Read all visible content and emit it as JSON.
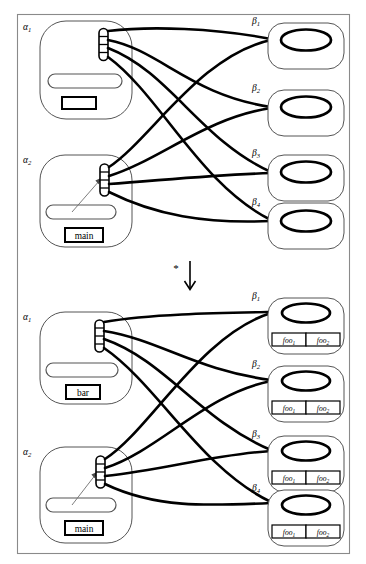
{
  "figure": {
    "transform_symbol": "*",
    "arrow_icon": "down-arrow-icon",
    "frame_color": "#8a8a8a",
    "edge_color": "#000000",
    "node_fill": "#ffffff"
  },
  "diagrams": [
    {
      "id": "source-graph",
      "position": "top",
      "alpha_nodes": [
        {
          "label": "α",
          "subscript": "1",
          "pill_text": "",
          "box_text": "",
          "has_pointer": false,
          "connector_slots": 4
        },
        {
          "label": "α",
          "subscript": "2",
          "pill_text": "",
          "box_text": "main",
          "has_pointer": true,
          "connector_slots": 4
        }
      ],
      "beta_nodes": [
        {
          "label": "β",
          "subscript": "1",
          "cells": []
        },
        {
          "label": "β",
          "subscript": "2",
          "cells": []
        },
        {
          "label": "β",
          "subscript": "3",
          "cells": []
        },
        {
          "label": "β",
          "subscript": "4",
          "cells": []
        }
      ]
    },
    {
      "id": "target-graph",
      "position": "bottom",
      "alpha_nodes": [
        {
          "label": "α",
          "subscript": "1",
          "pill_text": "",
          "box_text": "bar",
          "has_pointer": false,
          "connector_slots": 4
        },
        {
          "label": "α",
          "subscript": "2",
          "pill_text": "",
          "box_text": "main",
          "has_pointer": true,
          "connector_slots": 4
        }
      ],
      "beta_nodes": [
        {
          "label": "β",
          "subscript": "1",
          "cells": [
            {
              "name": "foo",
              "subscript": "1"
            },
            {
              "name": "foo",
              "subscript": "2"
            }
          ]
        },
        {
          "label": "β",
          "subscript": "2",
          "cells": [
            {
              "name": "foo",
              "subscript": "1"
            },
            {
              "name": "foo",
              "subscript": "2"
            }
          ]
        },
        {
          "label": "β",
          "subscript": "3",
          "cells": [
            {
              "name": "foo",
              "subscript": "1"
            },
            {
              "name": "foo",
              "subscript": "2"
            }
          ]
        },
        {
          "label": "β",
          "subscript": "4",
          "cells": [
            {
              "name": "foo",
              "subscript": "1"
            },
            {
              "name": "foo",
              "subscript": "2"
            }
          ]
        }
      ]
    }
  ]
}
